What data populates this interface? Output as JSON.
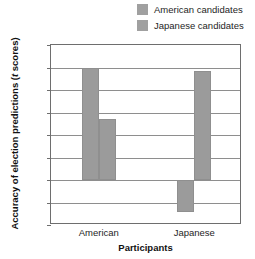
{
  "chart_data": {
    "type": "bar",
    "title": "",
    "xlabel": "Participants",
    "ylabel": "Accuracy of election predictions (t scores)",
    "ylabel_prefix": "Accuracy of election predictions (",
    "ylabel_italic": "t",
    "ylabel_suffix": " scores)",
    "categories": [
      "American",
      "Japanese"
    ],
    "series": [
      {
        "name": "American candidates",
        "values": [
          2.48,
          -0.72
        ],
        "color": "#9b9b9b"
      },
      {
        "name": "Japanese candidates",
        "values": [
          1.35,
          2.43
        ],
        "color": "#9b9b9b"
      }
    ],
    "ylim": [
      -1,
      3
    ],
    "ytick_labels": [
      "3",
      "2.5",
      "2",
      "1.5",
      "1",
      "0.5",
      "0",
      "−0.5",
      "−1"
    ],
    "ytick_values": [
      3,
      2.5,
      2,
      1.5,
      1,
      0.5,
      0,
      -0.5,
      -1
    ],
    "grid": true,
    "legend_position": "top-right"
  }
}
